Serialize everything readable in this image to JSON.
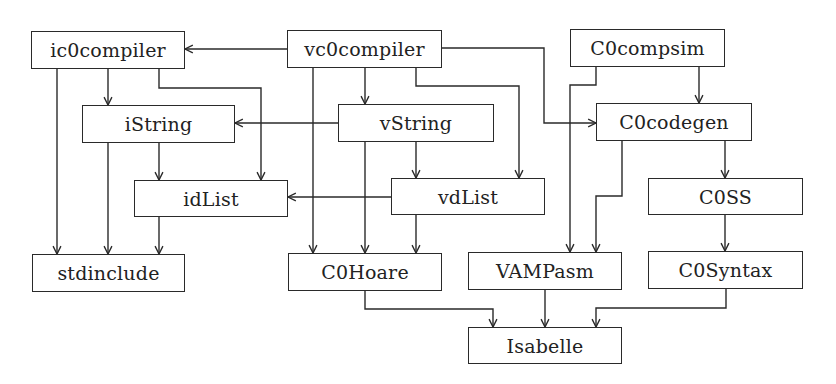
{
  "diagram": {
    "type": "dependency-graph",
    "nodes": {
      "ic0compiler": {
        "label": "ic0compiler",
        "x": 31,
        "y": 31,
        "w": 154,
        "h": 38
      },
      "vc0compiler": {
        "label": "vc0compiler",
        "x": 287,
        "y": 30,
        "w": 155,
        "h": 38
      },
      "C0compsim": {
        "label": "C0compsim",
        "x": 570,
        "y": 29,
        "w": 155,
        "h": 38
      },
      "iString": {
        "label": "iString",
        "x": 82,
        "y": 105,
        "w": 153,
        "h": 38
      },
      "vString": {
        "label": "vString",
        "x": 338,
        "y": 104,
        "w": 156,
        "h": 38
      },
      "C0codegen": {
        "label": "C0codegen",
        "x": 596,
        "y": 103,
        "w": 156,
        "h": 38
      },
      "idList": {
        "label": "idList",
        "x": 134,
        "y": 180,
        "w": 154,
        "h": 37
      },
      "vdList": {
        "label": "vdList",
        "x": 391,
        "y": 178,
        "w": 154,
        "h": 37
      },
      "C0SS": {
        "label": "C0SS",
        "x": 648,
        "y": 178,
        "w": 155,
        "h": 37
      },
      "stdinclude": {
        "label": "stdinclude",
        "x": 32,
        "y": 254,
        "w": 153,
        "h": 38
      },
      "C0Hoare": {
        "label": "C0Hoare",
        "x": 288,
        "y": 253,
        "w": 154,
        "h": 38
      },
      "VAMPasm": {
        "label": "VAMPasm",
        "x": 468,
        "y": 252,
        "w": 154,
        "h": 38
      },
      "C0Syntax": {
        "label": "C0Syntax",
        "x": 648,
        "y": 251,
        "w": 155,
        "h": 38
      },
      "Isabelle": {
        "label": "Isabelle",
        "x": 468,
        "y": 327,
        "w": 154,
        "h": 37
      }
    },
    "edges": [
      {
        "from": "vc0compiler",
        "to": "ic0compiler",
        "points": [
          [
            287,
            49
          ],
          [
            185,
            49
          ]
        ]
      },
      {
        "from": "ic0compiler",
        "to": "iString",
        "points": [
          [
            108,
            69
          ],
          [
            108,
            105
          ]
        ]
      },
      {
        "from": "ic0compiler",
        "to": "stdinclude",
        "points": [
          [
            57,
            69
          ],
          [
            57,
            254
          ]
        ]
      },
      {
        "from": "ic0compiler",
        "to": "idList",
        "points": [
          [
            159,
            69
          ],
          [
            159,
            88
          ],
          [
            261,
            88
          ],
          [
            261,
            180
          ]
        ]
      },
      {
        "from": "vc0compiler",
        "to": "vString",
        "points": [
          [
            365,
            68
          ],
          [
            365,
            104
          ]
        ]
      },
      {
        "from": "vc0compiler",
        "to": "C0Hoare",
        "points": [
          [
            313,
            68
          ],
          [
            313,
            253
          ]
        ]
      },
      {
        "from": "vc0compiler",
        "to": "vdList",
        "points": [
          [
            416,
            68
          ],
          [
            416,
            86
          ],
          [
            519,
            86
          ],
          [
            519,
            178
          ]
        ]
      },
      {
        "from": "vc0compiler",
        "to": "C0codegen",
        "points": [
          [
            442,
            48
          ],
          [
            544,
            48
          ],
          [
            544,
            123
          ],
          [
            596,
            123
          ]
        ]
      },
      {
        "from": "C0compsim",
        "to": "C0codegen",
        "points": [
          [
            699,
            67
          ],
          [
            699,
            103
          ]
        ]
      },
      {
        "from": "C0compsim",
        "to": "VAMPasm",
        "points": [
          [
            596,
            67
          ],
          [
            596,
            85
          ],
          [
            570,
            85
          ],
          [
            570,
            252
          ]
        ]
      },
      {
        "from": "vString",
        "to": "iString",
        "points": [
          [
            338,
            123
          ],
          [
            235,
            123
          ]
        ]
      },
      {
        "from": "iString",
        "to": "idList",
        "points": [
          [
            159,
            143
          ],
          [
            159,
            180
          ]
        ]
      },
      {
        "from": "iString",
        "to": "stdinclude",
        "points": [
          [
            108,
            143
          ],
          [
            108,
            254
          ]
        ]
      },
      {
        "from": "vString",
        "to": "vdList",
        "points": [
          [
            416,
            142
          ],
          [
            416,
            178
          ]
        ]
      },
      {
        "from": "vString",
        "to": "C0Hoare",
        "points": [
          [
            365,
            142
          ],
          [
            365,
            253
          ]
        ]
      },
      {
        "from": "C0codegen",
        "to": "C0SS",
        "points": [
          [
            725,
            141
          ],
          [
            725,
            178
          ]
        ]
      },
      {
        "from": "C0codegen",
        "to": "VAMPasm",
        "points": [
          [
            622,
            141
          ],
          [
            622,
            196
          ],
          [
            596,
            196
          ],
          [
            596,
            252
          ]
        ]
      },
      {
        "from": "vdList",
        "to": "idList",
        "points": [
          [
            391,
            197
          ],
          [
            288,
            197
          ]
        ]
      },
      {
        "from": "idList",
        "to": "stdinclude",
        "points": [
          [
            159,
            217
          ],
          [
            159,
            254
          ]
        ]
      },
      {
        "from": "vdList",
        "to": "C0Hoare",
        "points": [
          [
            416,
            215
          ],
          [
            416,
            253
          ]
        ]
      },
      {
        "from": "C0SS",
        "to": "C0Syntax",
        "points": [
          [
            725,
            215
          ],
          [
            725,
            251
          ]
        ]
      },
      {
        "from": "C0Hoare",
        "to": "Isabelle",
        "points": [
          [
            365,
            291
          ],
          [
            365,
            309
          ],
          [
            493,
            309
          ],
          [
            493,
            327
          ]
        ]
      },
      {
        "from": "VAMPasm",
        "to": "Isabelle",
        "points": [
          [
            545,
            290
          ],
          [
            545,
            327
          ]
        ]
      },
      {
        "from": "C0Syntax",
        "to": "Isabelle",
        "points": [
          [
            726,
            289
          ],
          [
            726,
            308
          ],
          [
            596,
            308
          ],
          [
            596,
            327
          ]
        ]
      }
    ],
    "colors": {
      "stroke": "#2a2a2a",
      "background": "#ffffff",
      "text": "#222222"
    }
  }
}
